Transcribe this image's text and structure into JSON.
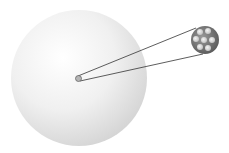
{
  "diagram": {
    "elements": [
      {
        "name": "atom-sphere",
        "description": "large pale grey sphere representing the atom"
      },
      {
        "name": "nucleus",
        "description": "tiny grey dot at atom center"
      },
      {
        "name": "magnified-nucleus",
        "description": "enlarged view of nucleus showing clustered particles"
      }
    ],
    "colors": {
      "background": "#ffffff",
      "sphere_light": "#ffffff",
      "sphere_dark": "#d6d6d6",
      "line": "#333333",
      "nucleus": "#8a8a8a",
      "particle": "#e8e8e8"
    }
  }
}
